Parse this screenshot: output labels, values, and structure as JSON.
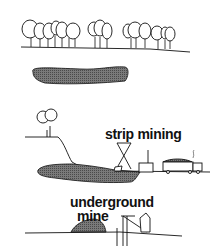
{
  "labels": {
    "strip_mining": "strip mining",
    "underground_line1": "underground",
    "underground_line2": "mine"
  },
  "panels": [
    {
      "name": "undisturbed-land",
      "elements": [
        "tree-row",
        "ground-line",
        "coal-seam"
      ]
    },
    {
      "name": "strip-mining",
      "elements": [
        "hill",
        "tree",
        "coal-seam",
        "dragline",
        "loader",
        "truck"
      ]
    },
    {
      "name": "underground-mine",
      "elements": [
        "spoil-heap",
        "ground-line",
        "headframe",
        "shaft"
      ]
    }
  ],
  "colors": {
    "ink": "#111111",
    "seam_fill": "#6e6e6e",
    "background": "#ffffff"
  }
}
